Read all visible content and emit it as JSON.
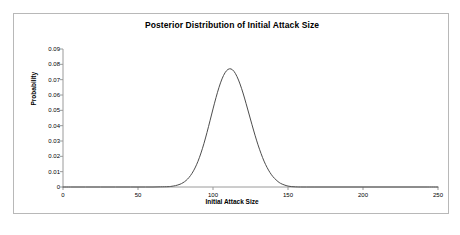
{
  "chart_data": {
    "type": "line",
    "title": "Posterior Distribution of Initial Attack Size",
    "xlabel": "Initial Attack Size",
    "ylabel": "Probability",
    "xlim": [
      0,
      250
    ],
    "ylim": [
      0,
      0.09
    ],
    "xticks": [
      "0",
      "50",
      "100",
      "150",
      "200",
      "250"
    ],
    "xtick_values": [
      0,
      50,
      100,
      150,
      200,
      250
    ],
    "yticks": [
      "0",
      "0.01",
      "0.02",
      "0.03",
      "0.04",
      "0.05",
      "0.06",
      "0.07",
      "0.08",
      "0.09"
    ],
    "ytick_values": [
      0,
      0.01,
      0.02,
      0.03,
      0.04,
      0.05,
      0.06,
      0.07,
      0.08,
      0.09
    ],
    "grid": false,
    "legend": false,
    "line_color": "#4d4d4d",
    "series": [
      {
        "name": "Posterior",
        "x": [
          0,
          5,
          10,
          15,
          20,
          25,
          30,
          35,
          40,
          45,
          50,
          55,
          60,
          65,
          70,
          72,
          75,
          78,
          80,
          82,
          84,
          86,
          88,
          90,
          92,
          94,
          96,
          98,
          100,
          102,
          104,
          106,
          108,
          110,
          112,
          114,
          116,
          118,
          120,
          122,
          124,
          126,
          128,
          130,
          132,
          134,
          136,
          138,
          140,
          142,
          145,
          150,
          155,
          160,
          170,
          180,
          190,
          200,
          210,
          220,
          230,
          240,
          250
        ],
        "y": [
          0,
          0,
          0,
          0,
          0,
          0,
          0,
          0,
          0,
          0,
          0,
          0,
          0,
          0.0001,
          0.0002,
          0.0004,
          0.0009,
          0.0018,
          0.0028,
          0.0042,
          0.0062,
          0.0089,
          0.0124,
          0.0168,
          0.0222,
          0.0285,
          0.0356,
          0.0432,
          0.0509,
          0.0583,
          0.065,
          0.0705,
          0.0745,
          0.0767,
          0.077,
          0.0754,
          0.072,
          0.0672,
          0.0613,
          0.0546,
          0.0476,
          0.0406,
          0.0338,
          0.0275,
          0.0219,
          0.0169,
          0.0128,
          0.0094,
          0.0067,
          0.0047,
          0.0024,
          0.0006,
          0.0001,
          0,
          0,
          0,
          0,
          0,
          0,
          0,
          0,
          0,
          0
        ]
      }
    ],
    "peak": {
      "x": 110,
      "y": 0.077
    }
  }
}
